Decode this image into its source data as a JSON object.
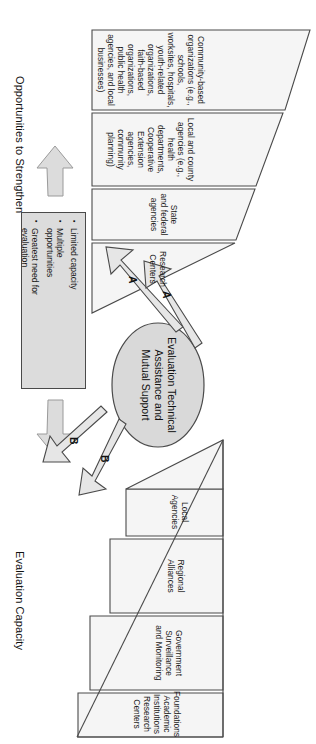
{
  "diagram": {
    "title_top": "Opportunities to Strengthen",
    "title_bottom": "Evaluation Capacity",
    "center": {
      "label": "Evaluation Technical\nAssistance and\nMutual Support"
    },
    "top_triangle": {
      "axis_label": "Opportunities to Strengthen",
      "bands": [
        {
          "id": "community-based-organizations",
          "label": "Community-based organizations (e.g., schools,\nworksites, hospitals, youth-related organizations,\nfaith-based organizations, public health\nagencies, and local businesses)"
        },
        {
          "id": "local-and-county-agencies",
          "label": "Local and county agencies (e.g., health\ndepartments, Cooperative\nExtension agencies,\ncommunity planning)"
        },
        {
          "id": "state-and-federal-agencies",
          "label": "State\nand federal\nagencies"
        },
        {
          "id": "research-centers",
          "label": "Research\nCenters"
        }
      ]
    },
    "bottom_triangle": {
      "axis_label": "Evaluation Capacity",
      "bands": [
        {
          "id": "local-agencies",
          "label": "Local\nAgencies"
        },
        {
          "id": "regional-alliances",
          "label": "Regional\nAlliances"
        },
        {
          "id": "government-surveillance-and-monitoring",
          "label": "Government\nSurveillance\nand Monitoring"
        },
        {
          "id": "foundations-academic-institutions-research-centers",
          "label": "Foundations\nAcademic Institutions\nResearch Centers"
        }
      ]
    },
    "callout_box": {
      "bullets": [
        "Limited capacity",
        "Multiple\nopportunities",
        "Greatest need for\nevaluation"
      ]
    },
    "arrows": {
      "a_upper": "A",
      "a_lower": "A",
      "b_upper": "B",
      "b_lower": "B"
    },
    "colors": {
      "fill_light": "#f2f2f2",
      "fill_gray": "#dcdcdc",
      "fill_ellipse": "#d9d9d9",
      "stroke": "#4a4a4a",
      "text": "#1a1a1a"
    }
  }
}
